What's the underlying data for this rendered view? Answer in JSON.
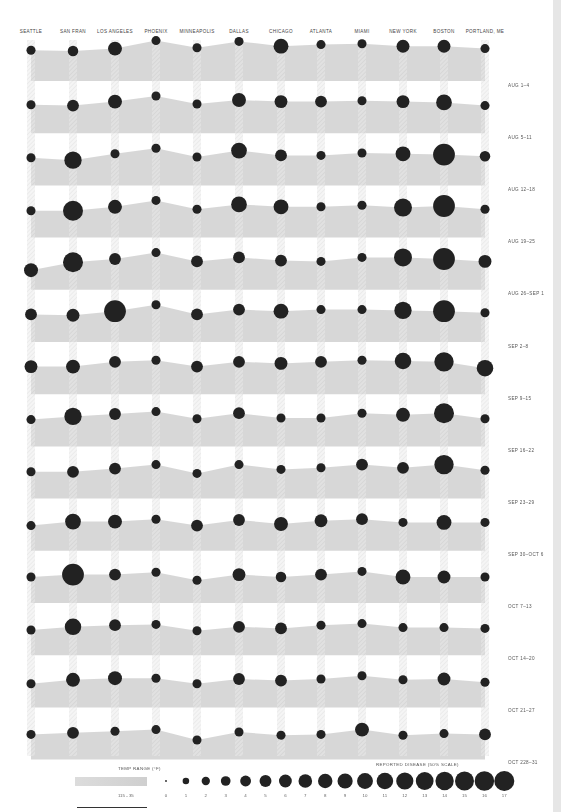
{
  "chart_data": {
    "type": "area",
    "title": "",
    "colors": {
      "area": "#d2d2d2",
      "dot": "#222222",
      "stripe": "#cfcfcf",
      "band_gap": "#f4f4f4"
    },
    "cities": [
      "SEATTLE",
      "SAN FRAN",
      "LOS ANGELES",
      "PHOENIX",
      "MINNEAPOLIS",
      "DALLAS",
      "CHICAGO",
      "ATLANTA",
      "MIAMI",
      "NEW YORK",
      "BOSTON",
      "PORTLAND, ME"
    ],
    "weeks": [
      "AUG 1–4",
      "AUG 5–11",
      "AUG 12–18",
      "AUG 19–25",
      "AUG 26–SEP 1",
      "SEP 2–8",
      "SEP 9–15",
      "SEP 16–22",
      "SEP 23–29",
      "SEP 30–OCT 6",
      "OCT 7–13",
      "OCT 14–20",
      "OCT 21–27",
      "OCT 228–31"
    ],
    "temp_unit": "°F",
    "temp_range": [
      35,
      115
    ],
    "series": [
      {
        "name": "AUG 1–4",
        "temp": [
          96,
          95,
          98,
          108,
          99,
          107,
          101,
          103,
          104,
          101,
          101,
          98
        ],
        "disease": [
          2,
          3,
          6,
          2,
          2,
          2,
          7,
          2,
          2,
          5,
          5,
          2
        ]
      },
      {
        "name": "AUG 5–11",
        "temp": [
          93,
          92,
          97,
          104,
          94,
          99,
          97,
          97,
          98,
          97,
          96,
          92
        ],
        "disease": [
          2,
          4,
          6,
          2,
          2,
          6,
          5,
          4,
          2,
          5,
          8,
          2
        ]
      },
      {
        "name": "AUG 12–18",
        "temp": [
          92,
          89,
          97,
          104,
          93,
          101,
          95,
          95,
          98,
          97,
          96,
          94
        ],
        "disease": [
          2,
          10,
          2,
          2,
          2,
          8,
          4,
          2,
          2,
          7,
          17,
          3
        ]
      },
      {
        "name": "AUG 19–25",
        "temp": [
          91,
          91,
          96,
          104,
          93,
          99,
          96,
          96,
          98,
          95,
          97,
          93
        ],
        "disease": [
          2,
          14,
          6,
          2,
          2,
          8,
          7,
          2,
          2,
          11,
          17,
          2
        ]
      },
      {
        "name": "AUG 26–SEP 1",
        "temp": [
          82,
          92,
          96,
          104,
          93,
          98,
          94,
          93,
          98,
          98,
          96,
          93
        ],
        "disease": [
          6,
          14,
          4,
          2,
          4,
          4,
          4,
          2,
          2,
          11,
          17,
          5
        ]
      },
      {
        "name": "SEP 2–8",
        "temp": [
          92,
          91,
          96,
          104,
          92,
          98,
          96,
          98,
          98,
          97,
          96,
          94
        ],
        "disease": [
          4,
          5,
          17,
          2,
          4,
          4,
          7,
          2,
          2,
          10,
          17,
          2
        ]
      },
      {
        "name": "SEP 2–8 (row 7)",
        "temp": [
          92,
          92,
          98,
          100,
          92,
          98,
          96,
          98,
          100,
          99,
          98,
          90
        ],
        "disease": [
          5,
          6,
          4,
          2,
          4,
          4,
          5,
          4,
          2,
          9,
          13,
          9
        ]
      },
      {
        "name": "SEP 9–15",
        "temp": [
          91,
          95,
          98,
          101,
          92,
          99,
          93,
          93,
          99,
          97,
          99,
          92
        ],
        "disease": [
          2,
          10,
          4,
          2,
          2,
          4,
          2,
          2,
          2,
          6,
          14,
          2
        ]
      },
      {
        "name": "SEP 16–22",
        "temp": [
          91,
          91,
          95,
          100,
          89,
          100,
          94,
          96,
          100,
          96,
          100,
          93
        ],
        "disease": [
          2,
          4,
          4,
          2,
          2,
          2,
          2,
          2,
          4,
          4,
          13,
          2
        ]
      },
      {
        "name": "SEP 23–29",
        "temp": [
          89,
          94,
          94,
          97,
          89,
          96,
          91,
          95,
          97,
          93,
          93,
          93
        ],
        "disease": [
          2,
          8,
          6,
          2,
          4,
          4,
          6,
          5,
          4,
          2,
          7,
          2
        ]
      },
      {
        "name": "SEP 30–OCT 6",
        "temp": [
          90,
          93,
          93,
          96,
          86,
          93,
          90,
          93,
          97,
          90,
          90,
          90
        ],
        "disease": [
          2,
          17,
          4,
          2,
          2,
          5,
          3,
          4,
          2,
          7,
          5,
          2
        ]
      },
      {
        "name": "OCT 7–13",
        "temp": [
          89,
          93,
          95,
          96,
          88,
          93,
          91,
          95,
          97,
          92,
          92,
          91
        ],
        "disease": [
          2,
          9,
          4,
          2,
          2,
          4,
          4,
          2,
          2,
          2,
          2,
          2
        ]
      },
      {
        "name": "OCT 14–20",
        "temp": [
          87,
          92,
          94,
          94,
          87,
          93,
          91,
          93,
          97,
          92,
          93,
          89
        ],
        "disease": [
          2,
          6,
          6,
          2,
          2,
          4,
          4,
          2,
          2,
          2,
          5,
          2
        ]
      },
      {
        "name": "OCT 228–31",
        "temp": [
          89,
          91,
          93,
          95,
          82,
          92,
          88,
          89,
          95,
          88,
          90,
          89
        ],
        "disease": [
          2,
          4,
          2,
          2,
          2,
          2,
          2,
          2,
          6,
          2,
          2,
          4
        ]
      }
    ],
    "legend": {
      "temp_title": "TEMP RANGE (°F)",
      "temp_range_label": "115 - 35",
      "disease_title": "REPORTED DISEASE (50% SCALE)",
      "disease_ticks": [
        "0",
        "1",
        "2",
        "3",
        "4",
        "5",
        "6",
        "7",
        "8",
        "9",
        "10",
        "11",
        "12",
        "13",
        "14",
        "15",
        "16",
        "17"
      ]
    },
    "grid": false
  },
  "header": {
    "cities": [
      "SEATTLE",
      "SAN FRAN",
      "LOS ANGELES",
      "PHOENIX",
      "MINNEAPOLIS",
      "DALLAS",
      "CHICAGO",
      "ATLANTA",
      "MIAMI",
      "NEW YORK",
      "BOSTON",
      "PORTLAND, ME"
    ]
  },
  "week_labels": [
    "AUG 1–4",
    "AUG 5–11",
    "AUG 12–18",
    "AUG 19–25",
    "AUG 26–SEP 1",
    "SEP 2–8",
    "SEP 9–15",
    "SEP 16–22",
    "SEP 23–29",
    "SEP 30–OCT 6",
    "OCT 7–13",
    "OCT 14–20",
    "OCT 21–27",
    "OCT 228–31"
  ]
}
